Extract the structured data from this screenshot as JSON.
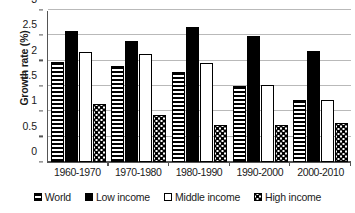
{
  "chart_data": {
    "type": "bar",
    "title": "",
    "subtitle": "",
    "xlabel": "",
    "ylabel": "Growth rate (%)",
    "ylim": [
      0,
      3
    ],
    "yticks": [
      0,
      0.5,
      1,
      1.5,
      2,
      2.5,
      3
    ],
    "ytick_labels": [
      "0",
      "0.5",
      "1",
      "1.5",
      "2",
      "2.5",
      "3"
    ],
    "grid": true,
    "legend_position": "bottom",
    "orientation": "vertical",
    "grouped": true,
    "categories": [
      "1960-1970",
      "1970-1980",
      "1980-1990",
      "1990-2000",
      "2000-2010"
    ],
    "series": [
      {
        "name": "World",
        "pattern": "horizontal-stripes",
        "values": [
          1.98,
          1.89,
          1.78,
          1.5,
          1.23
        ]
      },
      {
        "name": "Low income",
        "pattern": "solid-black",
        "values": [
          2.58,
          2.39,
          2.67,
          2.48,
          2.19
        ]
      },
      {
        "name": "Middle income",
        "pattern": "white-outline",
        "values": [
          2.18,
          2.13,
          1.96,
          1.52,
          1.22
        ]
      },
      {
        "name": "High income",
        "pattern": "dotted-speckle",
        "values": [
          1.15,
          0.93,
          0.74,
          0.73,
          0.77
        ]
      }
    ],
    "colors": {
      "axis": "#555555",
      "gridline": "#b9b9b9",
      "bar_border": "#000000",
      "bar_fill_solid": "#000000",
      "bar_fill_empty": "#ffffff",
      "background": "#ffffff",
      "text": "#1a1a1a"
    }
  }
}
